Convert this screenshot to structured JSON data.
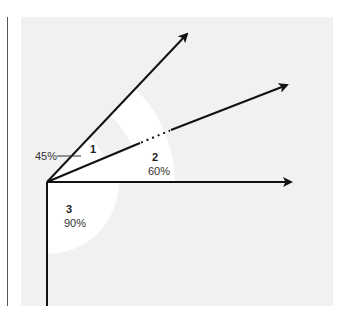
{
  "diagram": {
    "colors": {
      "background": "#ffffff",
      "panel": "#f1f1f1",
      "sector": "#ffffff",
      "stroke": "#111111",
      "left_rule": "#555555"
    },
    "origin": {
      "x": 47,
      "y": 182
    },
    "vectors": [
      {
        "id": "v1",
        "tip": {
          "x": 189,
          "y": 32
        }
      },
      {
        "id": "v2",
        "tip": {
          "x": 289,
          "y": 84
        },
        "dotted_segment": {
          "from": {
            "x": 140,
            "y": 143
          },
          "to": {
            "x": 170,
            "y": 130
          }
        }
      },
      {
        "id": "v3",
        "tip": {
          "x": 293,
          "y": 182
        }
      }
    ],
    "regions": [
      {
        "id": "1",
        "label": "1",
        "value": "45%"
      },
      {
        "id": "2",
        "label": "2",
        "value": "60%"
      },
      {
        "id": "3",
        "label": "3",
        "value": "90%"
      }
    ]
  }
}
